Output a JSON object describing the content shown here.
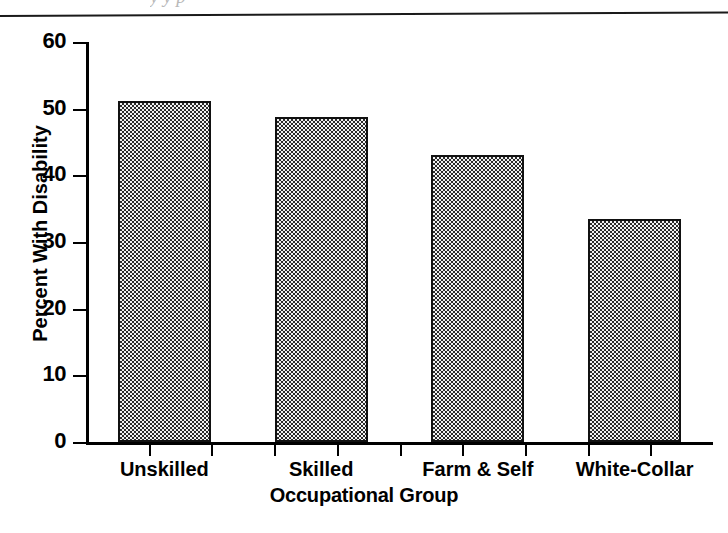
{
  "page": {
    "top_artifact_text": "y  y          p",
    "rule": "horizontal-rule"
  },
  "chart_data": {
    "type": "bar",
    "title": "",
    "categories": [
      "Unskilled",
      "Skilled",
      "Farm & Self",
      "White-Collar"
    ],
    "values": [
      51.2,
      48.7,
      43.0,
      33.5
    ],
    "xlabel": "Occupational Group",
    "ylabel": "Percent With Disability",
    "ylim": [
      0,
      60
    ],
    "ytick_step": 10,
    "yticks": [
      "0",
      "10",
      "20",
      "30",
      "40",
      "50",
      "60"
    ],
    "grid": false,
    "legend": false,
    "bar_fill": "#c8c8c8",
    "bar_border": "#111111",
    "axis_color": "#000000",
    "background": "#ffffff"
  }
}
